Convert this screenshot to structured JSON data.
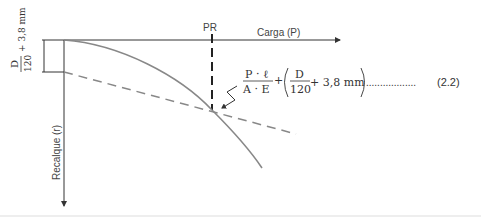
{
  "diagram": {
    "type": "load-settlement curve",
    "axes": {
      "x_label": "Carga (P)",
      "y_label": "Recalque (r)",
      "marker_label": "PR"
    },
    "left_bracket": {
      "numerator": "D",
      "denominator": "120",
      "suffix": "+ 3,8 mm"
    },
    "equation": {
      "frac1_num": "P · ℓ",
      "frac1_den": "A · E",
      "plus": "+",
      "frac2_num": "D",
      "frac2_den": "120",
      "frac2_suffix": "+ 3,8 mm",
      "leader_dots": "..................",
      "number": "(2.2)"
    },
    "colors": {
      "axis": "#333333",
      "curve": "#888888",
      "dashed": "#888888",
      "text": "#333333"
    }
  }
}
